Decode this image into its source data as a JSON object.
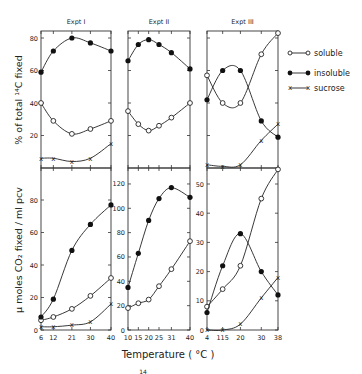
{
  "figure": {
    "xlabel": "Temperature  ( °C )",
    "ylabel_top": "% of total ¹⁴C fixed",
    "ylabel_bottom": "μ moles CO₂ fixed / ml pcv",
    "footer_mark": "14",
    "legend": [
      {
        "key": "soluble",
        "label": "soluble",
        "marker": "open-circle"
      },
      {
        "key": "insoluble",
        "label": "insoluble",
        "marker": "filled-circle"
      },
      {
        "key": "sucrose",
        "label": "sucrose",
        "marker": "x"
      }
    ]
  },
  "chart_data": [
    {
      "type": "line",
      "panel": "Expt I - top",
      "title": "Expt I",
      "xlabel": "Temperature (°C)",
      "ylabel": "% of total 14C fixed",
      "x": [
        6,
        12,
        21,
        30,
        40
      ],
      "xticks": [
        6,
        12,
        21,
        30,
        40
      ],
      "yticks": [
        20,
        40,
        60,
        80
      ],
      "ylim": [
        0,
        85
      ],
      "series": [
        {
          "name": "soluble",
          "values": [
            40,
            29,
            21,
            24,
            29
          ]
        },
        {
          "name": "insoluble",
          "values": [
            59,
            72,
            80,
            77,
            72
          ]
        },
        {
          "name": "sucrose",
          "values": [
            6,
            6,
            4,
            6,
            15
          ]
        }
      ]
    },
    {
      "type": "line",
      "panel": "Expt II - top",
      "title": "Expt II",
      "xlabel": "Temperature (°C)",
      "ylabel": "% of total 14C fixed",
      "x": [
        10,
        15,
        20,
        25,
        31,
        40
      ],
      "xticks": [
        10,
        15,
        20,
        25,
        31,
        40
      ],
      "yticks": [
        20,
        40,
        60,
        80
      ],
      "ylim": [
        0,
        85
      ],
      "series": [
        {
          "name": "soluble",
          "values": [
            35,
            27,
            23,
            26,
            31,
            40
          ]
        },
        {
          "name": "insoluble",
          "values": [
            66,
            76,
            79,
            76,
            71,
            61
          ]
        }
      ]
    },
    {
      "type": "line",
      "panel": "Expt III - top",
      "title": "Expt III",
      "xlabel": "Temperature (°C)",
      "ylabel": "% of total 14C fixed",
      "x": [
        4,
        11.5,
        20,
        30,
        38
      ],
      "xticks": [
        4,
        11.5,
        20,
        30,
        38
      ],
      "yticks": [
        20,
        40,
        60,
        80
      ],
      "ylim": [
        0,
        85
      ],
      "series": [
        {
          "name": "soluble",
          "values": [
            57,
            40,
            40,
            70,
            83
          ]
        },
        {
          "name": "insoluble",
          "values": [
            42,
            60,
            60,
            29,
            19
          ]
        },
        {
          "name": "sucrose",
          "values": [
            2,
            1,
            2,
            17,
            27
          ]
        }
      ]
    },
    {
      "type": "line",
      "panel": "Expt I - bottom",
      "title": "Expt I",
      "xlabel": "Temperature (°C)",
      "ylabel": "μmoles CO2 fixed / ml pcv",
      "x": [
        6,
        12,
        21,
        30,
        40
      ],
      "xticks": [
        6,
        12,
        21,
        30,
        40
      ],
      "yticks": [
        0,
        20,
        40,
        60,
        80
      ],
      "ylim": [
        0,
        100
      ],
      "series": [
        {
          "name": "soluble",
          "values": [
            6,
            8,
            13,
            21,
            32
          ]
        },
        {
          "name": "insoluble",
          "values": [
            8,
            19,
            49,
            65,
            77
          ]
        },
        {
          "name": "sucrose",
          "values": [
            2,
            2,
            3,
            5,
            16
          ]
        }
      ]
    },
    {
      "type": "line",
      "panel": "Expt II - bottom",
      "title": "Expt II",
      "xlabel": "Temperature (°C)",
      "ylabel": "μmoles CO2 fixed / ml pcv",
      "x": [
        10,
        15,
        20,
        25,
        31,
        40
      ],
      "xticks": [
        10,
        15,
        20,
        25,
        31,
        40
      ],
      "yticks": [
        0,
        20,
        40,
        60,
        80,
        100,
        120
      ],
      "ylim": [
        0,
        128
      ],
      "series": [
        {
          "name": "soluble",
          "values": [
            18,
            22,
            25,
            36,
            50,
            73
          ]
        },
        {
          "name": "insoluble",
          "values": [
            35,
            63,
            90,
            108,
            117,
            109
          ]
        }
      ]
    },
    {
      "type": "line",
      "panel": "Expt III - bottom",
      "title": "Expt III",
      "xlabel": "Temperature (°C)",
      "ylabel": "μmoles CO2 fixed / ml pcv",
      "x": [
        4,
        11.5,
        20,
        30,
        38
      ],
      "xticks": [
        4,
        11.5,
        20,
        30,
        38
      ],
      "xtick_labels": [
        "4",
        "115",
        "20",
        "30",
        "38"
      ],
      "yticks": [
        0,
        10,
        20,
        30,
        40,
        50
      ],
      "ylim": [
        0,
        56
      ],
      "series": [
        {
          "name": "soluble",
          "values": [
            8,
            14,
            22,
            45,
            55
          ]
        },
        {
          "name": "insoluble",
          "values": [
            6,
            22,
            33,
            20,
            12
          ]
        },
        {
          "name": "sucrose",
          "values": [
            0,
            0,
            2,
            11,
            18
          ]
        }
      ]
    }
  ]
}
